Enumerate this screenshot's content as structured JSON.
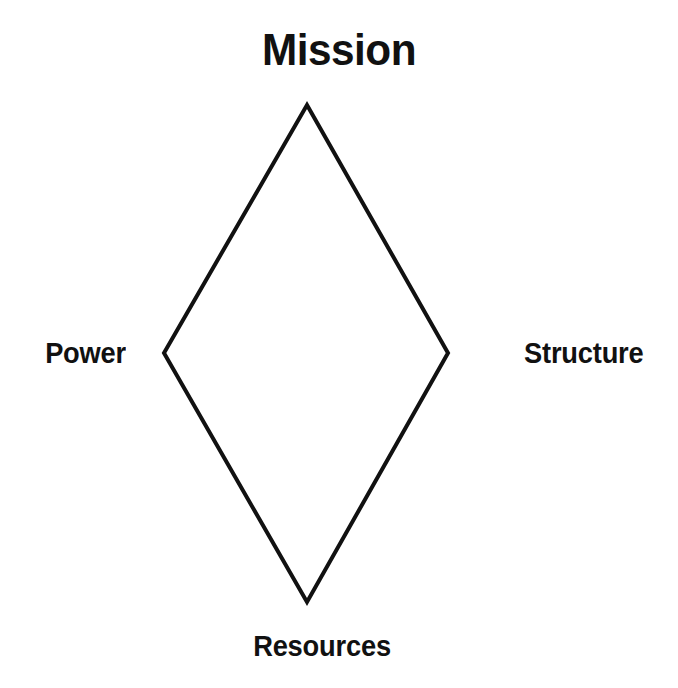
{
  "diagram": {
    "title": "Mission",
    "shape": "diamond",
    "stroke_color": "#111111",
    "background_color": "#ffffff",
    "stroke_width": 4,
    "vertices": {
      "top": {
        "label": "Mission",
        "x": 307,
        "y": 105
      },
      "right": {
        "label": "Structure",
        "x": 448,
        "y": 353
      },
      "bottom": {
        "label": "Resources",
        "x": 307,
        "y": 602
      },
      "left": {
        "label": "Power",
        "x": 164,
        "y": 353
      }
    },
    "labels": {
      "top": "Mission",
      "right": "Structure",
      "bottom": "Resources",
      "left": "Power"
    }
  }
}
